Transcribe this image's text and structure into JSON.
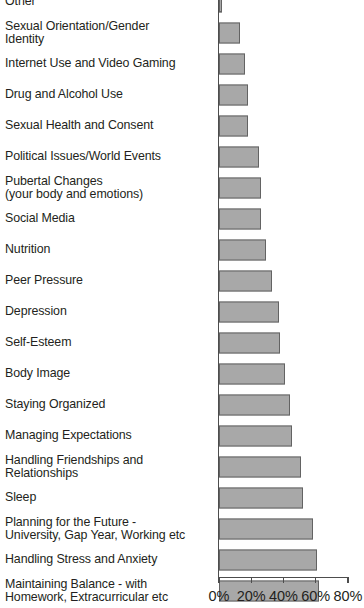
{
  "chart_data": {
    "type": "bar",
    "orientation": "horizontal",
    "title": "",
    "subtitle": "",
    "xlabel": "",
    "ylabel": "",
    "xlim": [
      0,
      80
    ],
    "grid": false,
    "legend": null,
    "xticks": [
      "0%",
      "20%",
      "40%",
      "60%",
      "80%"
    ],
    "xtick_values": [
      0,
      20,
      40,
      60,
      80
    ],
    "bar_color": "#a8a8a8",
    "bar_border_color": "#636363",
    "axis_color": "#4d4d4d",
    "text_color": "#231f20",
    "note": "Top bar ('Other') is clipped by the top edge of the screenshot.",
    "categories": [
      "Other",
      "Sexual Orientation/Gender\nIdentity",
      "Internet Use and Video Gaming",
      "Drug and Alcohol Use",
      "Sexual Health and Consent",
      "Political Issues/World Events",
      "Pubertal Changes\n(your body and emotions)",
      "Social Media",
      "Nutrition",
      "Peer Pressure",
      "Depression",
      "Self-Esteem",
      "Body Image",
      "Staying Organized",
      "Managing Expectations",
      "Handling Friendships and\nRelationships",
      "Sleep",
      "Planning for the Future -\nUniversity, Gap Year, Working etc",
      "Handling Stress and Anxiety",
      "Maintaining Balance - with\nHomework, Extracurricular etc"
    ],
    "values": [
      2,
      13,
      16,
      18,
      18,
      25,
      26,
      26,
      29,
      33,
      37,
      38,
      41,
      44,
      45,
      51,
      52,
      58,
      61,
      62
    ]
  }
}
